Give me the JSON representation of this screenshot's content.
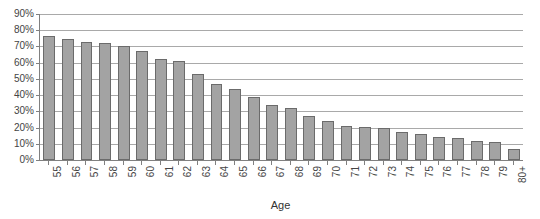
{
  "chart_data": {
    "type": "bar",
    "title": "",
    "xlabel": "Age",
    "ylabel": "",
    "ylim": [
      0,
      90
    ],
    "ytick_values": [
      0,
      10,
      20,
      30,
      40,
      50,
      60,
      70,
      80,
      90
    ],
    "ytick_labels": [
      "0%",
      "10%",
      "20%",
      "30%",
      "40%",
      "50%",
      "60%",
      "70%",
      "80%",
      "90%"
    ],
    "grid": true,
    "legend": null,
    "categories": [
      "55",
      "56",
      "57",
      "58",
      "59",
      "60",
      "61",
      "62",
      "63",
      "64",
      "65",
      "66",
      "67",
      "68",
      "69",
      "70",
      "71",
      "72",
      "73",
      "74",
      "75",
      "76",
      "77",
      "78",
      "79",
      "80+"
    ],
    "values": [
      76.5,
      74.5,
      73.0,
      72.0,
      70.0,
      67.0,
      62.0,
      61.0,
      53.0,
      47.0,
      44.0,
      39.0,
      34.0,
      32.0,
      27.0,
      24.0,
      21.0,
      20.5,
      19.5,
      17.0,
      16.0,
      14.0,
      13.5,
      11.5,
      11.0,
      7.0
    ],
    "bar_fill_color": "#a3a3a3",
    "bar_border_color": "#6b6b6b",
    "gridline_color": "#a9a9a9",
    "axis_color": "#808080",
    "background_color": "#ffffff"
  }
}
